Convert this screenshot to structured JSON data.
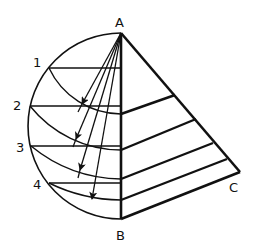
{
  "diagram": {
    "colors": {
      "stroke": "#111111",
      "background": "#ffffff"
    },
    "points": {
      "A": {
        "label": "A",
        "x": 121,
        "y": 33
      },
      "B": {
        "label": "B",
        "x": 121,
        "y": 219
      },
      "C": {
        "label": "C",
        "x": 240,
        "y": 172
      }
    },
    "division_points": [
      {
        "label": "1",
        "x": 49,
        "y": 68,
        "arc_end_y": 114,
        "arrow_tip": [
          82,
          104
        ],
        "parallel_end": [
          175,
          95
        ]
      },
      {
        "label": "2",
        "x": 30,
        "y": 106,
        "arc_end_y": 150,
        "arrow_tip": [
          76,
          139
        ],
        "parallel_end": [
          196,
          119
        ]
      },
      {
        "label": "3",
        "x": 31,
        "y": 146,
        "arc_end_y": 179,
        "arrow_tip": [
          80,
          170
        ],
        "parallel_end": [
          213,
          143
        ]
      },
      {
        "label": "4",
        "x": 49,
        "y": 183,
        "arc_end_y": 200,
        "arrow_tip": [
          92,
          199
        ],
        "parallel_end": [
          227,
          159
        ]
      }
    ],
    "labels": {
      "A": "A",
      "B": "B",
      "C": "C",
      "p1": "1",
      "p2": "2",
      "p3": "3",
      "p4": "4"
    }
  }
}
